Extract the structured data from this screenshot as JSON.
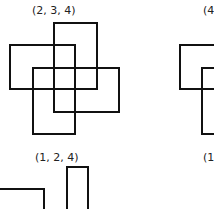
{
  "diagram": {
    "stroke_color": "#111111",
    "label_color": "#222222",
    "panels": [
      {
        "label": "(2, 3, 4)",
        "label_pos": {
          "x": 32,
          "y": 5
        },
        "rects": [
          {
            "x": 53,
            "y": 22,
            "w": 45,
            "h": 68
          },
          {
            "x": 9,
            "y": 44,
            "w": 67,
            "h": 46
          },
          {
            "x": 32,
            "y": 67,
            "w": 44,
            "h": 68
          },
          {
            "x": 53,
            "y": 67,
            "w": 67,
            "h": 46
          }
        ]
      },
      {
        "label": "(4",
        "label_pos": {
          "x": 203,
          "y": 5
        },
        "rects": [
          {
            "x": 179,
            "y": 44,
            "w": 60,
            "h": 46
          },
          {
            "x": 201,
            "y": 67,
            "w": 40,
            "h": 68
          }
        ]
      },
      {
        "label": "(1, 2, 4)",
        "label_pos": {
          "x": 35,
          "y": 152
        },
        "rects": [
          {
            "x": -2,
            "y": 188,
            "w": 47,
            "h": 40
          },
          {
            "x": 66,
            "y": 166,
            "w": 23,
            "h": 60
          }
        ]
      },
      {
        "label": "(1",
        "label_pos": {
          "x": 203,
          "y": 152
        },
        "rects": []
      }
    ]
  }
}
